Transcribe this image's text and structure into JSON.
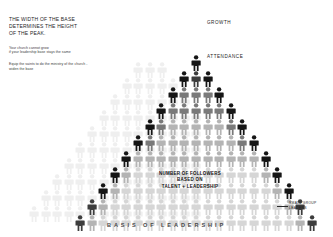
{
  "headline": {
    "line1": "THE WIDTH OF THE BASE",
    "line2": "DETERMINES THE HEIGHT",
    "line3": "OF THE PEAK."
  },
  "body": {
    "para1_line1": "Your church cannot grow",
    "para1_line2": "if your leadership base stays the same",
    "para2_line1": "Equip the saints to do the ministry of the church -",
    "para2_line2": "widen the base"
  },
  "labels": {
    "growth": "GROWTH",
    "attendance": "ATTENDANCE",
    "center_line1": "NUMBER OF FOLLOWERS",
    "center_line2": "BASED ON",
    "center_line3": "TALENT + LEADERSHIP",
    "small_group_line1": "SMALL GROUP",
    "small_group_line2": "LEADERS",
    "basis": "BASIS OF LEADERSHIP"
  },
  "colors": {
    "dark": "#161616",
    "mid_dark": "#3d3d3d",
    "mid": "#7a7a7a",
    "light": "#b4b4b4",
    "pale": "#d6d6d6",
    "ghost": "#efefef",
    "text_dark": "#1d1d1d",
    "background": "#ffffff"
  },
  "chart_data": {
    "type": "pyramid-pictogram",
    "title": "BASIS OF LEADERSHIP",
    "apex_label": "ATTENDANCE",
    "top_label": "GROWTH",
    "base_label": "BASIS OF LEADERSHIP",
    "row_counts": [
      1,
      3,
      5,
      7,
      9,
      11,
      13,
      15,
      17,
      19,
      21
    ],
    "rows": [
      {
        "index": 0,
        "count": 1,
        "y": 55,
        "scale": 1.0
      },
      {
        "index": 1,
        "count": 3,
        "y": 71,
        "scale": 1.0
      },
      {
        "index": 2,
        "count": 5,
        "y": 87,
        "scale": 1.0
      },
      {
        "index": 3,
        "count": 7,
        "y": 103,
        "scale": 1.0
      },
      {
        "index": 4,
        "count": 9,
        "y": 119,
        "scale": 1.0
      },
      {
        "index": 5,
        "count": 11,
        "y": 135,
        "scale": 1.0
      },
      {
        "index": 6,
        "count": 13,
        "y": 151,
        "scale": 1.0
      },
      {
        "index": 7,
        "count": 15,
        "y": 167,
        "scale": 1.0
      },
      {
        "index": 8,
        "count": 17,
        "y": 183,
        "scale": 1.0
      },
      {
        "index": 9,
        "count": 19,
        "y": 199,
        "scale": 1.0
      },
      {
        "index": 10,
        "count": 21,
        "y": 215,
        "scale": 1.0
      }
    ],
    "total_figures": 121,
    "legend": [
      {
        "name": "edge-leader",
        "color": "#161616",
        "meaning": "dark figures at row edges"
      },
      {
        "name": "interior",
        "color": "#7a7a7a",
        "meaning": "mid-gray interior figures"
      },
      {
        "name": "base",
        "color": "#d6d6d6",
        "meaning": "pale figures toward the base"
      },
      {
        "name": "ghost",
        "color": "#efefef",
        "meaning": "faint outline figures behind the left flank"
      }
    ]
  }
}
